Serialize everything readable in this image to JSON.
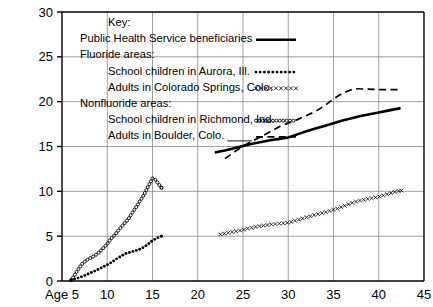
{
  "chart_data": {
    "type": "line",
    "title": "",
    "subtitle": "",
    "xlabel": "Age",
    "ylabel": "",
    "xlim": [
      5,
      45
    ],
    "ylim": [
      0,
      30
    ],
    "xticks": [
      5,
      10,
      15,
      20,
      25,
      30,
      35,
      40,
      45
    ],
    "xtick_labels": [
      "Age 5",
      "10",
      "15",
      "20",
      "25",
      "30",
      "35",
      "40",
      "45"
    ],
    "yticks": [
      0,
      5,
      10,
      15,
      20,
      25,
      30
    ],
    "ytick_labels": [
      "0",
      "5",
      "10",
      "15",
      "20",
      "25",
      "30"
    ],
    "grid": "both",
    "legend_position": "upper-left-inside",
    "legend_title": "Key:",
    "legend_groups": [
      {
        "label": "Fluoride areas:"
      },
      {
        "label": "Nonfluoride areas:"
      }
    ],
    "series": [
      {
        "name": "Public Health Service beneficiaries",
        "style": "solid-thick",
        "color": "#000000",
        "group": "",
        "points": [
          [
            22.0,
            14.35
          ],
          [
            23.0,
            14.55
          ],
          [
            24.0,
            14.8
          ],
          [
            25.0,
            15.05
          ],
          [
            26.0,
            15.3
          ],
          [
            27.0,
            15.5
          ],
          [
            28.0,
            15.7
          ],
          [
            29.0,
            15.85
          ],
          [
            30.0,
            16.0
          ],
          [
            31.0,
            16.35
          ],
          [
            32.0,
            16.7
          ],
          [
            33.0,
            17.0
          ],
          [
            34.0,
            17.3
          ],
          [
            35.0,
            17.6
          ],
          [
            36.0,
            17.9
          ],
          [
            37.0,
            18.15
          ],
          [
            38.0,
            18.4
          ],
          [
            39.0,
            18.6
          ],
          [
            40.0,
            18.8
          ],
          [
            41.0,
            19.0
          ],
          [
            42.3,
            19.25
          ]
        ]
      },
      {
        "name": "School children in Aurora, Ill.",
        "style": "dotted",
        "color": "#000000",
        "group": "Fluoride areas:",
        "points": [
          [
            6.0,
            0.15
          ],
          [
            6.5,
            0.25
          ],
          [
            7.0,
            0.4
          ],
          [
            7.5,
            0.6
          ],
          [
            8.0,
            0.85
          ],
          [
            8.5,
            1.05
          ],
          [
            9.0,
            1.3
          ],
          [
            9.5,
            1.55
          ],
          [
            10.0,
            1.8
          ],
          [
            10.5,
            2.1
          ],
          [
            11.0,
            2.45
          ],
          [
            11.5,
            2.75
          ],
          [
            12.0,
            3.05
          ],
          [
            12.5,
            3.2
          ],
          [
            13.0,
            3.35
          ],
          [
            13.5,
            3.5
          ],
          [
            14.0,
            3.75
          ],
          [
            14.5,
            4.1
          ],
          [
            15.0,
            4.5
          ],
          [
            15.5,
            4.8
          ],
          [
            16.0,
            5.0
          ]
        ]
      },
      {
        "name": "Adults in Colorado Springs, Colo.",
        "style": "x-marks",
        "color": "#000000",
        "group": "Fluoride areas:",
        "points": [
          [
            22.5,
            5.2
          ],
          [
            23.0,
            5.3
          ],
          [
            23.5,
            5.4
          ],
          [
            24.0,
            5.5
          ],
          [
            24.5,
            5.6
          ],
          [
            25.0,
            5.7
          ],
          [
            25.5,
            5.85
          ],
          [
            26.0,
            5.95
          ],
          [
            26.5,
            6.05
          ],
          [
            27.0,
            6.15
          ],
          [
            27.5,
            6.2
          ],
          [
            28.0,
            6.3
          ],
          [
            28.5,
            6.35
          ],
          [
            29.0,
            6.4
          ],
          [
            29.5,
            6.45
          ],
          [
            30.0,
            6.5
          ],
          [
            30.5,
            6.65
          ],
          [
            31.0,
            6.8
          ],
          [
            31.5,
            6.95
          ],
          [
            32.0,
            7.1
          ],
          [
            32.5,
            7.25
          ],
          [
            33.0,
            7.4
          ],
          [
            33.5,
            7.5
          ],
          [
            34.0,
            7.65
          ],
          [
            34.5,
            7.8
          ],
          [
            35.0,
            7.95
          ],
          [
            35.5,
            8.1
          ],
          [
            36.0,
            8.3
          ],
          [
            36.5,
            8.5
          ],
          [
            37.0,
            8.7
          ],
          [
            37.5,
            8.85
          ],
          [
            38.0,
            9.0
          ],
          [
            38.5,
            9.1
          ],
          [
            39.0,
            9.2
          ],
          [
            39.5,
            9.3
          ],
          [
            40.0,
            9.4
          ],
          [
            40.5,
            9.55
          ],
          [
            41.0,
            9.7
          ],
          [
            41.5,
            9.85
          ],
          [
            42.0,
            10.0
          ],
          [
            42.5,
            10.1
          ]
        ]
      },
      {
        "name": "School children in Richmond, Ind.",
        "style": "circles",
        "color": "#000000",
        "group": "Nonfluoride areas:",
        "points": [
          [
            6.0,
            0.1
          ],
          [
            6.3,
            0.5
          ],
          [
            6.6,
            1.0
          ],
          [
            7.0,
            1.6
          ],
          [
            7.3,
            2.0
          ],
          [
            7.7,
            2.3
          ],
          [
            8.0,
            2.5
          ],
          [
            8.5,
            2.75
          ],
          [
            9.0,
            3.1
          ],
          [
            9.5,
            3.6
          ],
          [
            10.0,
            4.15
          ],
          [
            10.4,
            4.7
          ],
          [
            10.8,
            5.1
          ],
          [
            11.2,
            5.6
          ],
          [
            11.6,
            6.1
          ],
          [
            12.0,
            6.55
          ],
          [
            12.3,
            6.85
          ],
          [
            12.6,
            7.35
          ],
          [
            13.0,
            7.95
          ],
          [
            13.4,
            8.55
          ],
          [
            13.8,
            9.2
          ],
          [
            14.2,
            9.9
          ],
          [
            14.6,
            10.7
          ],
          [
            15.0,
            11.45
          ],
          [
            15.3,
            11.3
          ],
          [
            15.6,
            10.9
          ],
          [
            16.0,
            10.4
          ]
        ]
      },
      {
        "name": "Adults in Boulder, Colo.",
        "style": "dashed",
        "color": "#000000",
        "group": "Nonfluoride areas:",
        "points": [
          [
            23.0,
            13.65
          ],
          [
            25.0,
            15.05
          ],
          [
            27.0,
            16.1
          ],
          [
            29.0,
            17.2
          ],
          [
            31.0,
            18.0
          ],
          [
            33.0,
            18.9
          ],
          [
            34.0,
            19.55
          ],
          [
            35.0,
            20.3
          ],
          [
            36.0,
            20.95
          ],
          [
            37.3,
            21.45
          ],
          [
            38.5,
            21.4
          ],
          [
            40.0,
            21.35
          ],
          [
            42.3,
            21.35
          ]
        ]
      }
    ]
  },
  "legend": {
    "title": "Key:",
    "entries": [
      {
        "label": "Public Health Service beneficiaries",
        "style": "solid-thick",
        "indent": 0
      },
      {
        "label": "Fluoride areas:",
        "style": "none",
        "indent": 0
      },
      {
        "label": "School children in Aurora, Ill.",
        "style": "dotted",
        "indent": 1
      },
      {
        "label": "Adults in Colorado Springs, Colo.",
        "style": "x-marks",
        "indent": 1
      },
      {
        "label": "Nonfluoride areas:",
        "style": "none",
        "indent": 0
      },
      {
        "label": "School children in Richmond, Ind.",
        "style": "circles",
        "indent": 1
      },
      {
        "label": "Adults in Boulder, Colo.",
        "style": "dashed",
        "indent": 1
      }
    ]
  },
  "colors": {
    "ink": "#000000",
    "grid": "#888888",
    "axis": "#000000",
    "background": "#ffffff"
  }
}
